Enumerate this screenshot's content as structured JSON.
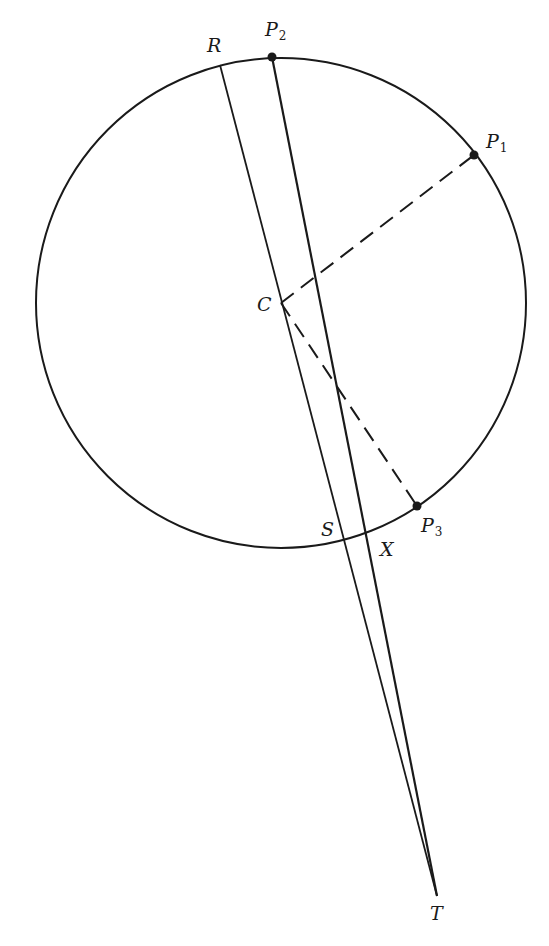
{
  "figure": {
    "type": "geometric-construction",
    "stroke_color": "#1a1a1a",
    "background": "#ffffff",
    "circle": {
      "cx": 281,
      "cy": 303,
      "r": 245
    },
    "points": {
      "R": {
        "x": 220,
        "y": 65,
        "label": "R"
      },
      "P2": {
        "x": 272,
        "y": 57,
        "label": "P",
        "sub": "2"
      },
      "P1": {
        "x": 474,
        "y": 155,
        "label": "P",
        "sub": "1"
      },
      "C": {
        "x": 281,
        "y": 303,
        "label": "C"
      },
      "P3": {
        "x": 417,
        "y": 506,
        "label": "P",
        "sub": "3"
      },
      "S": {
        "x": 345,
        "y": 541,
        "label": "S"
      },
      "X": {
        "x": 368,
        "y": 534,
        "label": "X"
      },
      "T": {
        "x": 437,
        "y": 896,
        "label": "T"
      }
    },
    "solid_lines": [
      {
        "name": "line-R-T",
        "from": "R",
        "to": "T"
      },
      {
        "name": "line-P2-T",
        "from": "P2",
        "to": "T"
      }
    ],
    "dashed_lines": [
      {
        "name": "radius-C-P1",
        "from": "C",
        "to": "P1"
      },
      {
        "name": "radius-C-P3",
        "from": "C",
        "to": "P3"
      }
    ],
    "marked_points": [
      "P1",
      "P2",
      "P3"
    ]
  }
}
